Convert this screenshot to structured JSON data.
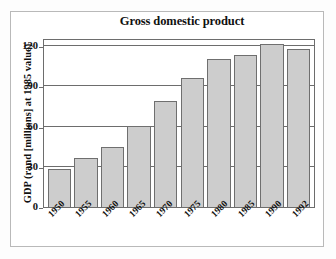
{
  "figure": {
    "background_color": "#ffffff",
    "frame_color": "#b9b9b9"
  },
  "chart_data": {
    "type": "bar",
    "title": "Gross domestic product",
    "xlabel": "",
    "ylabel": "GDP (rand [millions] at 1985 value)",
    "categories": [
      "1950",
      "1955",
      "1960",
      "1965",
      "1970",
      "1975",
      "1980",
      "1985",
      "1990",
      "1992"
    ],
    "values": [
      28,
      36.5,
      45,
      60.5,
      79,
      96,
      110.5,
      113.5,
      121.5,
      117.5
    ],
    "ylim": [
      0,
      126
    ],
    "yticks": [
      0,
      30,
      60,
      90,
      120
    ],
    "ytick_labels": [
      "0",
      "30",
      "60",
      "90",
      "120"
    ],
    "grid": true,
    "grid_axis": "y",
    "legend": null,
    "bar_fill_color": "#cdcdcd",
    "bar_edge_color": "#6f6f6f",
    "axis_color": "#6d6d6d",
    "xtick_rotation": -45
  }
}
